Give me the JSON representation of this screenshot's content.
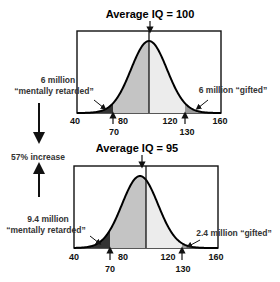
{
  "top_panel": {
    "title": "Average IQ = 100",
    "mean": 100,
    "left_annotation_line1": "6 million",
    "left_annotation_line2": "“mentally retarded”",
    "right_annotation": "6 million “gifted”",
    "x_ticks": [
      "40",
      "80",
      "120",
      "160"
    ],
    "markers": [
      "70",
      "130"
    ]
  },
  "middle": {
    "increase_label": "57% increase"
  },
  "bottom_panel": {
    "title": "Average IQ = 95",
    "mean": 95,
    "left_annotation_line1": "9.4 million",
    "left_annotation_line2": "“mentally retarded”",
    "right_annotation": "2.4 million “gifted”",
    "x_ticks": [
      "40",
      "80",
      "120",
      "160"
    ],
    "markers": [
      "70",
      "130"
    ]
  },
  "chart_data": [
    {
      "type": "area",
      "title": "Average IQ = 100",
      "x_range": [
        40,
        160
      ],
      "distribution": {
        "mean": 100,
        "sd": 15
      },
      "shaded_regions": [
        {
          "from": 40,
          "to": 70,
          "label": "6 million “mentally retarded”"
        },
        {
          "from": 70,
          "to": 100,
          "label": "below mean"
        },
        {
          "from": 130,
          "to": 160,
          "label": "6 million “gifted”"
        }
      ],
      "x_tick_labels": [
        "40",
        "80",
        "120",
        "160"
      ],
      "markers": [
        70,
        130
      ]
    },
    {
      "type": "area",
      "title": "Average IQ = 95",
      "x_range": [
        40,
        160
      ],
      "distribution": {
        "mean": 95,
        "sd": 15
      },
      "shaded_regions": [
        {
          "from": 40,
          "to": 70,
          "label": "9.4 million “mentally retarded”"
        },
        {
          "from": 70,
          "to": 100,
          "label": "below 100"
        },
        {
          "from": 130,
          "to": 160,
          "label": "2.4 million “gifted”"
        }
      ],
      "x_tick_labels": [
        "40",
        "80",
        "120",
        "160"
      ],
      "markers": [
        70,
        130
      ],
      "annotation": "57% increase"
    }
  ]
}
